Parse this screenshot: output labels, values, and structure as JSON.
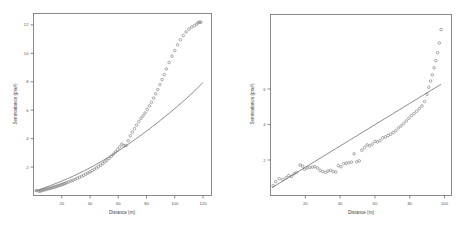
{
  "figure": {
    "panel_count": 2,
    "background_color": "#ffffff",
    "marker_color": "#6a6a6a",
    "line_color": "#5d5d5d",
    "axis_color": "#6d6d6d"
  },
  "chart_data": [
    {
      "type": "scatter",
      "panel": "left",
      "title": "",
      "xlabel": "Distance (m)",
      "ylabel": "Semivariance (psu²)",
      "xlim": [
        0,
        126
      ],
      "ylim": [
        0,
        12.8
      ],
      "xticks": [
        20,
        40,
        60,
        80,
        100,
        120
      ],
      "xticklabels": [
        "20",
        "40",
        "60",
        "80",
        "100",
        "120"
      ],
      "yticks": [
        2,
        4,
        6,
        8,
        10,
        12
      ],
      "yticklabels": [
        "2",
        "4",
        "6",
        "8",
        "10",
        "12"
      ],
      "grid": false,
      "legend": "none",
      "series": [
        {
          "name": "empirical semivariogram",
          "style": "open-circle",
          "x": [
            2,
            3.5,
            4.5,
            5.5,
            6.5,
            7.5,
            8.5,
            9.5,
            10.5,
            11.5,
            12.5,
            13.5,
            14.5,
            15.5,
            16.5,
            17.5,
            18.5,
            19.5,
            20.5,
            21.5,
            22.5,
            23.5,
            25,
            26.5,
            28,
            29.5,
            31,
            32.5,
            34,
            35.5,
            37,
            38.5,
            40,
            41.5,
            43,
            44.5,
            46,
            47.5,
            49,
            50.5,
            52,
            53.5,
            55,
            56.5,
            58,
            59.5,
            61,
            62.5,
            64,
            65.5,
            67,
            68.5,
            70,
            71.5,
            73,
            74.5,
            76,
            77.5,
            79,
            80.5,
            82,
            83.5,
            85,
            86.5,
            88,
            89.5,
            91,
            92.5,
            94,
            96,
            98,
            100,
            102,
            104,
            106,
            108,
            110,
            112,
            114,
            115.5,
            116.5,
            117.5,
            118.5
          ],
          "y": [
            0.35,
            0.32,
            0.3,
            0.34,
            0.37,
            0.4,
            0.42,
            0.45,
            0.48,
            0.5,
            0.53,
            0.56,
            0.59,
            0.62,
            0.65,
            0.68,
            0.72,
            0.75,
            0.79,
            0.82,
            0.86,
            0.9,
            0.96,
            1.02,
            1.08,
            1.14,
            1.21,
            1.28,
            1.35,
            1.42,
            1.5,
            1.58,
            1.66,
            1.75,
            1.84,
            1.93,
            2.03,
            2.13,
            2.24,
            2.36,
            2.48,
            2.61,
            2.75,
            2.9,
            3.06,
            3.23,
            3.42,
            3.62,
            3.5,
            3.52,
            3.85,
            4.2,
            4.45,
            4.7,
            4.95,
            5.2,
            5.42,
            5.6,
            5.8,
            6.05,
            6.3,
            6.55,
            6.85,
            7.15,
            7.45,
            7.8,
            8.15,
            8.5,
            8.9,
            9.35,
            9.8,
            10.2,
            10.6,
            10.95,
            11.25,
            11.5,
            11.7,
            11.85,
            11.95,
            12.05,
            12.15,
            12.2,
            12.18
          ]
        },
        {
          "name": "fitted model",
          "style": "line",
          "x": [
            1,
            6,
            12,
            18,
            24,
            30,
            36,
            42,
            48,
            54,
            60,
            66,
            72,
            78,
            84,
            90,
            96,
            102,
            108,
            114,
            120
          ],
          "y": [
            0.3,
            0.48,
            0.7,
            0.93,
            1.18,
            1.45,
            1.74,
            2.05,
            2.39,
            2.75,
            3.13,
            3.53,
            3.95,
            4.38,
            4.83,
            5.3,
            5.78,
            6.28,
            6.8,
            7.35,
            7.95
          ]
        }
      ]
    },
    {
      "type": "scatter",
      "panel": "right",
      "title": "",
      "xlabel": "Distance (m)",
      "ylabel": "Semivariance (psu²)",
      "xlim": [
        0,
        104
      ],
      "ylim": [
        0,
        10.2
      ],
      "xticks": [
        20,
        40,
        60,
        80,
        100
      ],
      "xticklabels": [
        "20",
        "40",
        "60",
        "80",
        "100"
      ],
      "yticks": [
        2,
        4,
        6
      ],
      "yticklabels": [
        "2",
        "4",
        "6"
      ],
      "grid": false,
      "legend": "none",
      "series": [
        {
          "name": "empirical semivariogram",
          "style": "open-circle",
          "x": [
            1.5,
            3,
            5,
            7,
            9,
            10.5,
            12,
            13.5,
            15,
            17,
            18.5,
            19.5,
            21,
            22.5,
            24,
            25.5,
            27,
            28.5,
            30,
            31.5,
            33,
            34.5,
            36,
            37.5,
            39,
            40.5,
            42,
            43.5,
            45,
            46.5,
            48,
            49.5,
            51,
            52.5,
            54,
            55.5,
            57,
            58.5,
            60,
            61.5,
            63,
            64.5,
            66,
            67.5,
            69,
            70.5,
            72,
            73.5,
            75,
            76.5,
            78,
            79.5,
            81,
            82.5,
            84,
            85.5,
            87,
            88.5,
            90,
            91,
            92,
            93,
            94,
            95,
            96,
            97,
            98
          ],
          "y": [
            0.55,
            0.78,
            0.95,
            0.9,
            1.0,
            1.12,
            1.08,
            1.22,
            1.3,
            1.72,
            1.65,
            1.48,
            1.55,
            1.58,
            1.6,
            1.62,
            1.55,
            1.42,
            1.35,
            1.3,
            1.38,
            1.42,
            1.35,
            1.32,
            1.68,
            1.62,
            1.8,
            1.82,
            1.85,
            1.88,
            2.35,
            1.9,
            1.95,
            2.55,
            2.7,
            2.85,
            2.8,
            2.9,
            3.05,
            3.02,
            3.1,
            3.25,
            3.3,
            3.38,
            3.45,
            3.55,
            3.65,
            3.8,
            3.92,
            4.05,
            4.2,
            4.35,
            4.5,
            4.62,
            4.75,
            4.9,
            5.05,
            5.3,
            5.7,
            6.1,
            6.45,
            6.8,
            7.2,
            7.6,
            8.05,
            8.6,
            9.35
          ]
        },
        {
          "name": "fitted model",
          "style": "line",
          "x": [
            1,
            10,
            20,
            30,
            40,
            50,
            60,
            70,
            80,
            90,
            98
          ],
          "y": [
            0.45,
            0.99,
            1.59,
            2.19,
            2.79,
            3.39,
            3.99,
            4.59,
            5.19,
            5.79,
            6.27
          ]
        }
      ]
    }
  ]
}
